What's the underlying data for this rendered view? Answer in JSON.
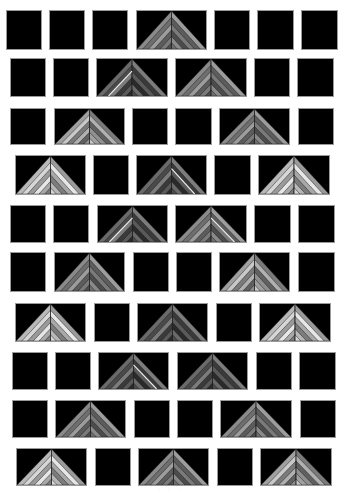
{
  "figure": {
    "background": "#ffffff",
    "tile_color": "#000000",
    "caption": "· · ·"
  },
  "palettes": {
    "mid": [
      "#8a8a8a",
      "#6e6e6e",
      "#9c9c9c",
      "#5c5c5c",
      "#7a7a7a",
      "#4c4c4c"
    ],
    "light": [
      "#b8b8b8",
      "#d6d6d6",
      "#9a9a9a",
      "#e6e6e6",
      "#a8a8a8",
      "#7c7c7c"
    ],
    "dark": [
      "#6a6a6a",
      "#4a4a4a",
      "#7c7c7c",
      "#3a3a3a",
      "#5a5a5a",
      "#2a2a2a"
    ],
    "mixed": [
      "#a0a0a0",
      "#c8c8c8",
      "#7a7a7a",
      "#b0b0b0",
      "#606060",
      "#909090"
    ]
  },
  "rows": [
    {
      "y": 10,
      "h": 40,
      "tiles": [
        {
          "x": 6,
          "w": 36,
          "type": "plain"
        },
        {
          "x": 49,
          "w": 36,
          "type": "plain"
        },
        {
          "x": 92,
          "w": 36,
          "type": "plain"
        },
        {
          "x": 136,
          "w": 71,
          "type": "pyramid",
          "apex": 0.5,
          "palette": "mid"
        },
        {
          "x": 214,
          "w": 36,
          "type": "plain"
        },
        {
          "x": 257,
          "w": 37,
          "type": "plain"
        },
        {
          "x": 301,
          "w": 37,
          "type": "plain"
        }
      ]
    },
    {
      "y": 58,
      "h": 39,
      "tiles": [
        {
          "x": 10,
          "w": 36,
          "type": "plain"
        },
        {
          "x": 53,
          "w": 36,
          "type": "plain"
        },
        {
          "x": 96,
          "w": 72,
          "type": "pyramid",
          "apex": 0.5,
          "palette": "dark",
          "highlight": "left"
        },
        {
          "x": 175,
          "w": 72,
          "type": "pyramid",
          "apex": 0.5,
          "palette": "mid"
        },
        {
          "x": 254,
          "w": 36,
          "type": "plain"
        },
        {
          "x": 297,
          "w": 37,
          "type": "plain"
        }
      ]
    },
    {
      "y": 108,
      "h": 37,
      "tiles": [
        {
          "x": 10,
          "w": 36,
          "type": "plain"
        },
        {
          "x": 54,
          "w": 71,
          "type": "pyramid",
          "apex": 0.5,
          "palette": "mixed"
        },
        {
          "x": 132,
          "w": 36,
          "type": "plain"
        },
        {
          "x": 175,
          "w": 37,
          "type": "plain"
        },
        {
          "x": 219,
          "w": 71,
          "type": "pyramid",
          "apex": 0.5,
          "palette": "mid"
        },
        {
          "x": 298,
          "w": 36,
          "type": "plain"
        }
      ]
    },
    {
      "y": 155,
      "h": 40,
      "tiles": [
        {
          "x": 15,
          "w": 71,
          "type": "pyramid",
          "apex": 0.5,
          "palette": "light"
        },
        {
          "x": 93,
          "w": 36,
          "type": "plain"
        },
        {
          "x": 136,
          "w": 71,
          "type": "pyramid",
          "apex": 0.5,
          "palette": "dark",
          "highlight": "right"
        },
        {
          "x": 214,
          "w": 37,
          "type": "plain"
        },
        {
          "x": 258,
          "w": 72,
          "type": "pyramid",
          "apex": 0.5,
          "palette": "light"
        }
      ]
    },
    {
      "y": 205,
      "h": 38,
      "tiles": [
        {
          "x": 10,
          "w": 36,
          "type": "plain"
        },
        {
          "x": 53,
          "w": 36,
          "type": "plain"
        },
        {
          "x": 97,
          "w": 71,
          "type": "pyramid",
          "apex": 0.5,
          "palette": "dark",
          "highlight": "left"
        },
        {
          "x": 175,
          "w": 72,
          "type": "pyramid",
          "apex": 0.5,
          "palette": "mid",
          "highlight": "right"
        },
        {
          "x": 254,
          "w": 37,
          "type": "plain"
        },
        {
          "x": 298,
          "w": 37,
          "type": "plain"
        }
      ]
    },
    {
      "y": 252,
      "h": 40,
      "tiles": [
        {
          "x": 10,
          "w": 36,
          "type": "plain"
        },
        {
          "x": 54,
          "w": 71,
          "type": "pyramid",
          "apex": 0.5,
          "palette": "mid"
        },
        {
          "x": 133,
          "w": 36,
          "type": "plain"
        },
        {
          "x": 176,
          "w": 36,
          "type": "plain"
        },
        {
          "x": 219,
          "w": 71,
          "type": "pyramid",
          "apex": 0.5,
          "palette": "mixed"
        },
        {
          "x": 298,
          "w": 37,
          "type": "plain"
        }
      ]
    },
    {
      "y": 303,
      "h": 39,
      "tiles": [
        {
          "x": 15,
          "w": 71,
          "type": "pyramid",
          "apex": 0.5,
          "palette": "light"
        },
        {
          "x": 94,
          "w": 36,
          "type": "plain"
        },
        {
          "x": 137,
          "w": 71,
          "type": "pyramid",
          "apex": 0.5,
          "palette": "dark"
        },
        {
          "x": 216,
          "w": 36,
          "type": "plain"
        },
        {
          "x": 259,
          "w": 72,
          "type": "pyramid",
          "apex": 0.5,
          "palette": "light"
        }
      ]
    },
    {
      "y": 352,
      "h": 38,
      "tiles": [
        {
          "x": 12,
          "w": 36,
          "type": "plain"
        },
        {
          "x": 55,
          "w": 36,
          "type": "plain"
        },
        {
          "x": 98,
          "w": 71,
          "type": "pyramid",
          "apex": 0.5,
          "palette": "dark",
          "highlight": "right"
        },
        {
          "x": 177,
          "w": 71,
          "type": "pyramid",
          "apex": 0.5,
          "palette": "dark"
        },
        {
          "x": 256,
          "w": 36,
          "type": "plain"
        },
        {
          "x": 299,
          "w": 37,
          "type": "plain"
        }
      ]
    },
    {
      "y": 400,
      "h": 38,
      "tiles": [
        {
          "x": 12,
          "w": 36,
          "type": "plain"
        },
        {
          "x": 55,
          "w": 71,
          "type": "pyramid",
          "apex": 0.5,
          "palette": "mid"
        },
        {
          "x": 134,
          "w": 36,
          "type": "plain"
        },
        {
          "x": 177,
          "w": 36,
          "type": "plain"
        },
        {
          "x": 220,
          "w": 72,
          "type": "pyramid",
          "apex": 0.5,
          "palette": "mid"
        },
        {
          "x": 300,
          "w": 36,
          "type": "plain"
        }
      ]
    },
    {
      "y": 448,
      "h": 38,
      "tiles": [
        {
          "x": 16,
          "w": 71,
          "type": "pyramid",
          "apex": 0.5,
          "palette": "light"
        },
        {
          "x": 95,
          "w": 36,
          "type": "plain"
        },
        {
          "x": 138,
          "w": 71,
          "type": "pyramid",
          "apex": 0.5,
          "palette": "mid"
        },
        {
          "x": 217,
          "w": 36,
          "type": "plain"
        },
        {
          "x": 260,
          "w": 72,
          "type": "pyramid",
          "apex": 0.5,
          "palette": "mixed"
        }
      ]
    }
  ]
}
